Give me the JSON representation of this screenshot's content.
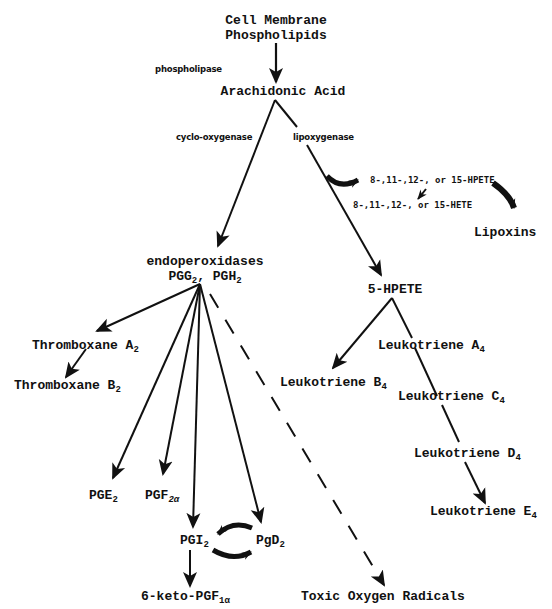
{
  "diagram": {
    "colors": {
      "ink": "#111111",
      "background": "#ffffff"
    },
    "nodes": {
      "membrane_line1": "Cell Membrane",
      "membrane_line2": "Phospholipids",
      "arachidonic": "Arachidonic Acid",
      "endo_line1": "endoperoxidases",
      "endo_pgg": "PGG",
      "endo_pgg_sub": "2",
      "endo_sep": ", ",
      "endo_pgh": "PGH",
      "endo_pgh_sub": "2",
      "hpete_group": "8-,11-,12-, or 15-HPETE",
      "hete_group": "8-,11-,12-, or 15-HETE",
      "lipoxins": "Lipoxins",
      "five_hpete": "5-HPETE",
      "txa": "Thromboxane A",
      "txa_sub": "2",
      "txb": "Thromboxane B",
      "txb_sub": "2",
      "lta": "Leukotriene A",
      "lta_sub": "4",
      "ltb": "Leukotriene B",
      "ltb_sub": "4",
      "ltc": "Leukotriene C",
      "ltc_sub": "4",
      "ltd": "Leukotriene D",
      "ltd_sub": "4",
      "lte": "Leukotriene E",
      "lte_sub": "4",
      "pge": "PGE",
      "pge_sub": "2",
      "pgf": "PGF",
      "pgf_sub": "2α",
      "pgi": "PGI",
      "pgi_sub": "2",
      "pgd": "PgD",
      "pgd_sub": "2",
      "keto": "6-keto-PGF",
      "keto_sub": "1α",
      "toxic": "Toxic Oxygen Radicals"
    },
    "enzymes": {
      "phospholipase": "phospholipase",
      "cyclooxygenase": "cyclo-oxygenase",
      "lipoxygenase": "lipoxygenase"
    },
    "edges": [
      {
        "from": "Cell Membrane Phospholipids",
        "to": "Arachidonic Acid",
        "label": "phospholipase",
        "style": "solid"
      },
      {
        "from": "Arachidonic Acid",
        "to": "endoperoxidases PGG2, PGH2",
        "label": "cyclo-oxygenase",
        "style": "solid"
      },
      {
        "from": "Arachidonic Acid",
        "to": "5-HPETE",
        "label": "lipoxygenase",
        "style": "solid"
      },
      {
        "from": "lipoxygenase path",
        "to": "8-,11-,12-, or 15-HPETE",
        "style": "curved"
      },
      {
        "from": "8-,11-,12-, or 15-HPETE",
        "to": "8-,11-,12-, or 15-HETE",
        "style": "solid"
      },
      {
        "from": "8-,11-,12-, or 15-HPETE",
        "to": "Lipoxins",
        "style": "curved"
      },
      {
        "from": "endoperoxidases PGG2, PGH2",
        "to": "Thromboxane A2",
        "style": "solid"
      },
      {
        "from": "Thromboxane A2",
        "to": "Thromboxane B2",
        "style": "solid"
      },
      {
        "from": "endoperoxidases PGG2, PGH2",
        "to": "PGE2",
        "style": "solid"
      },
      {
        "from": "endoperoxidases PGG2, PGH2",
        "to": "PGF2α",
        "style": "solid"
      },
      {
        "from": "endoperoxidases PGG2, PGH2",
        "to": "PGI2",
        "style": "solid"
      },
      {
        "from": "endoperoxidases PGG2, PGH2",
        "to": "PgD2",
        "style": "solid"
      },
      {
        "from": "endoperoxidases PGG2, PGH2",
        "to": "Toxic Oxygen Radicals",
        "style": "dashed"
      },
      {
        "from": "PGI2",
        "to": "PgD2",
        "style": "curved-bidirectional"
      },
      {
        "from": "PGI2",
        "to": "6-keto-PGF1α",
        "style": "solid"
      },
      {
        "from": "5-HPETE",
        "to": "Leukotriene B4",
        "style": "solid"
      },
      {
        "from": "5-HPETE",
        "to": "Leukotriene E4",
        "via": [
          "Leukotriene A4",
          "Leukotriene C4",
          "Leukotriene D4"
        ],
        "style": "solid"
      }
    ]
  }
}
